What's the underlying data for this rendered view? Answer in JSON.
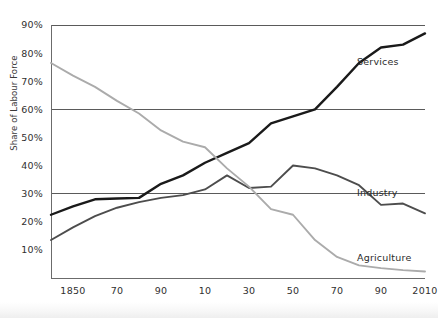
{
  "chart_data": {
    "type": "line",
    "title": "",
    "xlabel": "",
    "ylabel": "Share of Labour Force",
    "ylabel_display": "Share of Labour Force",
    "xlim": [
      1840,
      2010
    ],
    "ylim": [
      0,
      90
    ],
    "grid": "horizontal gridlines at 30%, 60%, 90%",
    "legend_position": "inline labels at end of each line",
    "y_ticks": [
      "10%",
      "20%",
      "30%",
      "40%",
      "50%",
      "60%",
      "70%",
      "80%",
      "90%"
    ],
    "y_tick_values": [
      10,
      20,
      30,
      40,
      50,
      60,
      70,
      80,
      90
    ],
    "gridline_values": [
      30,
      60,
      90
    ],
    "x_ticks": [
      "1850",
      "70",
      "90",
      "10",
      "30",
      "50",
      "70",
      "90",
      "2010"
    ],
    "x_tick_values": [
      1850,
      1870,
      1890,
      1910,
      1930,
      1950,
      1970,
      1990,
      2010
    ],
    "x": [
      1840,
      1850,
      1860,
      1870,
      1880,
      1890,
      1900,
      1910,
      1920,
      1930,
      1940,
      1950,
      1960,
      1970,
      1980,
      1990,
      2000,
      2010
    ],
    "series": [
      {
        "name": "Services",
        "color": "#1a1a1a",
        "stroke_width": 2.4,
        "label": "Services",
        "values": [
          22.5,
          25.5,
          28.0,
          28.3,
          28.5,
          33.5,
          36.5,
          41.0,
          44.5,
          48.0,
          55.0,
          57.5,
          60.0,
          68.0,
          76.5,
          82.0,
          83.0,
          87.0
        ]
      },
      {
        "name": "Industry",
        "color": "#4d4d4d",
        "stroke_width": 1.9,
        "label": "Industry",
        "values": [
          13.5,
          18.0,
          22.0,
          25.0,
          27.0,
          28.5,
          29.5,
          31.5,
          36.5,
          32.0,
          32.5,
          40.0,
          39.0,
          36.5,
          33.0,
          26.0,
          26.5,
          23.0
        ]
      },
      {
        "name": "Agriculture",
        "color": "#ababab",
        "stroke_width": 1.9,
        "label": "Agriculture",
        "values": [
          76.5,
          72.0,
          68.0,
          63.0,
          58.5,
          52.5,
          48.5,
          46.5,
          39.0,
          32.5,
          24.5,
          22.5,
          13.5,
          7.5,
          4.5,
          3.5,
          2.8,
          2.3
        ]
      }
    ]
  },
  "axis": {
    "y_title": "Share of Labour Force"
  }
}
